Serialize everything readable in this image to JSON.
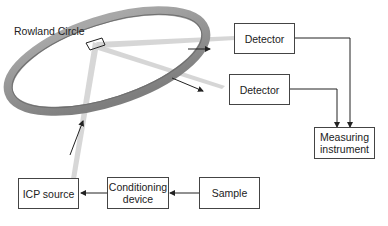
{
  "diagram": {
    "title_label": "Rowland Circle",
    "boxes": {
      "detector_1": "Detector",
      "detector_2": "Detector",
      "measuring_instrument_line1": "Measuring",
      "measuring_instrument_line2": "instrument",
      "icp_source": "ICP source",
      "conditioning_device_line1": "Conditioning",
      "conditioning_device_line2": "device",
      "sample": "Sample"
    },
    "flows": [
      {
        "from": "Sample",
        "to": "Conditioning device"
      },
      {
        "from": "Conditioning device",
        "to": "ICP source"
      },
      {
        "from": "ICP source",
        "to": "Rowland Circle"
      },
      {
        "from": "Rowland Circle",
        "to": "Detector"
      },
      {
        "from": "Rowland Circle",
        "to": "Detector"
      },
      {
        "from": "Detector",
        "to": "Measuring instrument"
      },
      {
        "from": "Detector",
        "to": "Measuring instrument"
      }
    ],
    "colors": {
      "ring": "#8f8f8f",
      "beam": "#c8c8c8",
      "line": "#222222"
    }
  }
}
